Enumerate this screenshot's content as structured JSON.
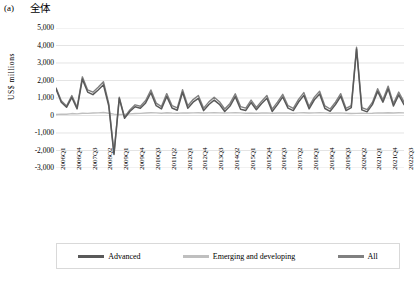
{
  "panel": {
    "label": "(a)",
    "title": "全体"
  },
  "axes": {
    "ylabel": "US$ millions",
    "yticks": [
      "5,000",
      "4,000",
      "3,000",
      "2,000",
      "1,000",
      "0",
      "-1,000",
      "-2,000",
      "-3,000"
    ],
    "ytick_values": [
      5000,
      4000,
      3000,
      2000,
      1000,
      0,
      -1000,
      -2000,
      -3000
    ],
    "xticks": [
      "2006Q1",
      "2006Q4",
      "2007Q3",
      "2008Q2",
      "2009Q1",
      "2009Q4",
      "2010Q3",
      "2011Q2",
      "2012Q1",
      "2012Q4",
      "2013Q3",
      "2014Q2",
      "2015Q1",
      "2015Q4",
      "2016Q3",
      "2017Q2",
      "2018Q1",
      "2018Q4",
      "2019Q3",
      "2020Q2",
      "2021Q1",
      "2021Q4",
      "2022Q3"
    ]
  },
  "legend": {
    "items": [
      {
        "label": "Advanced",
        "color": "#595959"
      },
      {
        "label": "Emerging and developing",
        "color": "#bfbfbf"
      },
      {
        "label": "All",
        "color": "#808080"
      }
    ]
  },
  "colors": {
    "advanced": "#595959",
    "emerging": "#bfbfbf",
    "all": "#808080",
    "grid": "#d9d9d9",
    "legend_border": "#d9d9d9"
  },
  "chart_data": {
    "type": "line",
    "title": "全体",
    "xlabel": "",
    "ylabel": "US$ millions",
    "ylim": [
      -3000,
      5000
    ],
    "grid": true,
    "legend_position": "bottom",
    "x": [
      "2006Q1",
      "2006Q2",
      "2006Q3",
      "2006Q4",
      "2007Q1",
      "2007Q2",
      "2007Q3",
      "2007Q4",
      "2008Q1",
      "2008Q2",
      "2008Q3",
      "2008Q4",
      "2009Q1",
      "2009Q2",
      "2009Q3",
      "2009Q4",
      "2010Q1",
      "2010Q2",
      "2010Q3",
      "2010Q4",
      "2011Q1",
      "2011Q2",
      "2011Q3",
      "2011Q4",
      "2012Q1",
      "2012Q2",
      "2012Q3",
      "2012Q4",
      "2013Q1",
      "2013Q2",
      "2013Q3",
      "2013Q4",
      "2014Q1",
      "2014Q2",
      "2014Q3",
      "2014Q4",
      "2015Q1",
      "2015Q2",
      "2015Q3",
      "2015Q4",
      "2016Q1",
      "2016Q2",
      "2016Q3",
      "2016Q4",
      "2017Q1",
      "2017Q2",
      "2017Q3",
      "2017Q4",
      "2018Q1",
      "2018Q2",
      "2018Q3",
      "2018Q4",
      "2019Q1",
      "2019Q2",
      "2019Q3",
      "2019Q4",
      "2020Q1",
      "2020Q2",
      "2020Q3",
      "2020Q4",
      "2021Q1",
      "2021Q2",
      "2021Q3",
      "2021Q4",
      "2022Q1",
      "2022Q2",
      "2022Q3"
    ],
    "series": [
      {
        "name": "Advanced",
        "color": "#595959",
        "values": [
          1520,
          760,
          470,
          1030,
          380,
          2080,
          1340,
          1190,
          1460,
          1760,
          560,
          -2230,
          980,
          -160,
          230,
          500,
          410,
          720,
          1300,
          560,
          380,
          1090,
          430,
          300,
          1330,
          420,
          760,
          980,
          280,
          630,
          880,
          640,
          230,
          540,
          1080,
          360,
          290,
          740,
          330,
          680,
          990,
          230,
          620,
          1060,
          420,
          280,
          770,
          1150,
          380,
          900,
          1230,
          400,
          240,
          620,
          1100,
          280,
          450,
          3800,
          320,
          210,
          620,
          1380,
          760,
          1520,
          540,
          1180,
          620
        ]
      },
      {
        "name": "Emerging and developing",
        "color": "#bfbfbf",
        "values": [
          60,
          80,
          70,
          110,
          90,
          130,
          120,
          140,
          150,
          170,
          130,
          80,
          60,
          70,
          90,
          110,
          120,
          140,
          160,
          150,
          130,
          160,
          140,
          130,
          150,
          140,
          150,
          160,
          140,
          150,
          160,
          150,
          140,
          150,
          160,
          150,
          130,
          140,
          130,
          140,
          150,
          130,
          140,
          150,
          140,
          130,
          150,
          160,
          140,
          150,
          160,
          150,
          130,
          140,
          150,
          130,
          110,
          120,
          130,
          120,
          130,
          150,
          140,
          160,
          140,
          160,
          150
        ]
      },
      {
        "name": "All",
        "color": "#808080",
        "values": [
          1580,
          840,
          540,
          1140,
          470,
          2210,
          1460,
          1330,
          1610,
          1930,
          690,
          -2150,
          1040,
          -90,
          320,
          610,
          530,
          860,
          1460,
          710,
          510,
          1250,
          570,
          430,
          1480,
          560,
          910,
          1140,
          420,
          780,
          1040,
          790,
          370,
          690,
          1240,
          510,
          420,
          880,
          460,
          820,
          1140,
          360,
          760,
          1210,
          560,
          410,
          920,
          1310,
          520,
          1050,
          1390,
          550,
          370,
          760,
          1250,
          410,
          560,
          3900,
          450,
          330,
          750,
          1530,
          900,
          1680,
          680,
          1340,
          770
        ]
      }
    ]
  }
}
